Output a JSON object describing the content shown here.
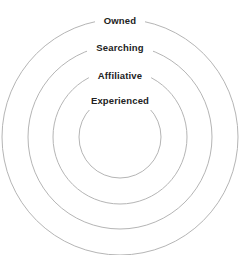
{
  "diagram": {
    "type": "concentric-circles",
    "title": "",
    "background_color": "#ffffff",
    "ring_stroke_color": "#b5b5b5",
    "label_text_color": "#222222",
    "center": {
      "x": 120,
      "y": 137
    },
    "rings": [
      {
        "label": "Owned",
        "radius": 118,
        "level": 1,
        "label_y": 13
      },
      {
        "label": "Searching",
        "radius": 92,
        "level": 2,
        "label_y": 40
      },
      {
        "label": "Affiliative",
        "radius": 67,
        "level": 3,
        "label_y": 68
      },
      {
        "label": "Experienced",
        "radius": 41,
        "level": 4,
        "label_y": 93
      }
    ]
  },
  "chart_data": {
    "type": "pie",
    "title": "",
    "subtitle": "",
    "xlabel": "",
    "ylabel": "",
    "categories": [
      "Owned",
      "Searching",
      "Affiliative",
      "Experienced"
    ],
    "values": [
      118,
      92,
      67,
      41
    ],
    "legend_position": "none",
    "grid": false,
    "annotations": [
      "Owned",
      "Searching",
      "Affiliative",
      "Experienced"
    ]
  }
}
